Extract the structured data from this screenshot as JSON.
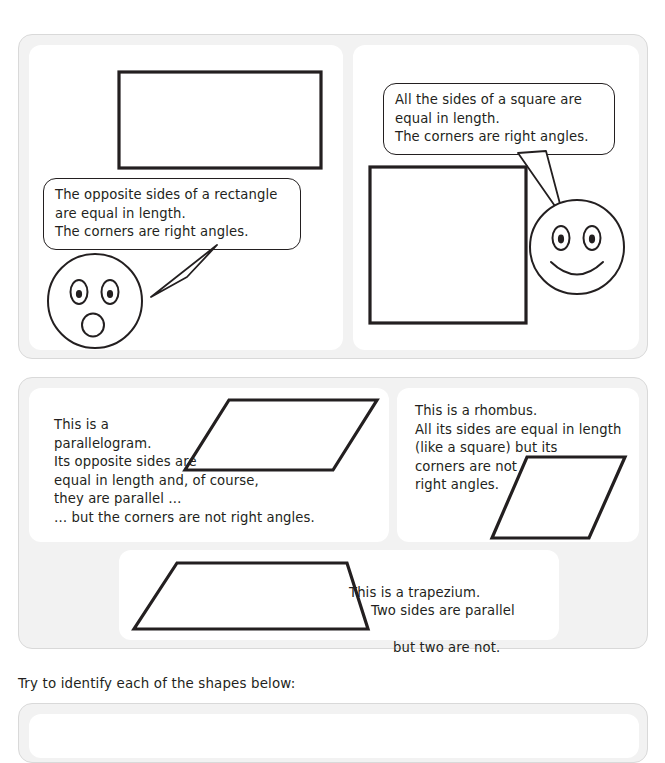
{
  "page": {
    "instruction": "Try to identify each of the shapes below:"
  },
  "panels": [
    {
      "name": "quadrilaterals-right-angles",
      "cards": [
        {
          "shape": "rectangle",
          "bubble_text": "The opposite sides of a rectangle\nare equal in length.\nThe corners are right angles.",
          "face": "surprised-face"
        },
        {
          "shape": "square",
          "bubble_text": "All the sides of a square are\nequal in length.\nThe corners are right angles.",
          "face": "smiling-face"
        }
      ]
    },
    {
      "name": "quadrilaterals-no-right-angles",
      "cards": [
        {
          "shape": "parallelogram",
          "text": "This is a\nparallelogram.\nIts opposite sides are\nequal in length and, of course,\nthey are parallel …\n… but the corners are not right angles."
        },
        {
          "shape": "rhombus",
          "text": "This is a rhombus.\nAll its sides are equal in length\n(like a square) but its\ncorners are not\nright angles."
        },
        {
          "shape": "trapezium",
          "text_line1": "This is a trapezium.",
          "text_line2": "Two sides are parallel",
          "text_line3": "but two are not."
        }
      ]
    }
  ],
  "colors": {
    "ink": "#231f20",
    "panel_background": "#f2f2f2",
    "panel_border": "#d9d9d9",
    "card_background": "#ffffff"
  }
}
